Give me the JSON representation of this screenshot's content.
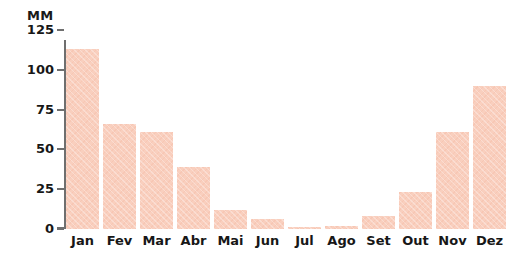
{
  "chart_data": {
    "type": "bar",
    "title": "",
    "subtitle": "",
    "xlabel": "",
    "ylabel": "MM",
    "unit_label": "MM",
    "categories": [
      "Jan",
      "Fev",
      "Mar",
      "Abr",
      "Mai",
      "Jun",
      "Jul",
      "Ago",
      "Set",
      "Out",
      "Nov",
      "Dez"
    ],
    "values": [
      113,
      66,
      61,
      39,
      12,
      6,
      1.5,
      2,
      8,
      23,
      61,
      90
    ],
    "ylim": [
      0,
      125
    ],
    "yticks": [
      0,
      25,
      50,
      75,
      100,
      125
    ],
    "ytick_labels": [
      "0",
      "25",
      "50",
      "75",
      "100",
      "125"
    ],
    "grid": false,
    "legend": null,
    "bar_color": "#f9cfbe",
    "axis_color": "#6f6f6f",
    "text_color": "#171717",
    "background": "#ffffff"
  }
}
